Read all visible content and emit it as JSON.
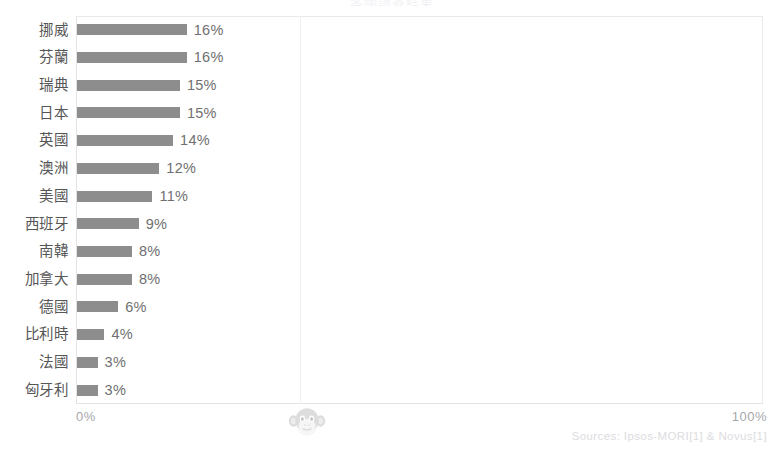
{
  "chart_data": {
    "type": "bar",
    "orientation": "horizontal",
    "title": "各國調查結果",
    "categories": [
      "挪威",
      "芬蘭",
      "瑞典",
      "日本",
      "英國",
      "澳洲",
      "美國",
      "西班牙",
      "南韓",
      "加拿大",
      "德國",
      "比利時",
      "法國",
      "匈牙利"
    ],
    "values": [
      16,
      16,
      15,
      15,
      14,
      12,
      11,
      9,
      8,
      8,
      6,
      4,
      3,
      3
    ],
    "value_labels": [
      "16%",
      "16%",
      "15%",
      "15%",
      "14%",
      "12%",
      "11%",
      "9%",
      "8%",
      "8%",
      "6%",
      "4%",
      "3%",
      "3%"
    ],
    "xlabel": "",
    "ylabel": "",
    "xlim": [
      0,
      100
    ],
    "xtick_labels": [
      "0%",
      "100%"
    ],
    "grid": true,
    "legend": false,
    "bar_color": "#8d8d8d",
    "label_color": "#565656",
    "value_color": "#6f6f6f",
    "axis_color": "#e3e3e6"
  },
  "axis": {
    "left_tick": "0%",
    "right_tick": "100%"
  },
  "footer": {
    "source": "Sources: Ipsos-MORI[1] & Novus[1]"
  },
  "watermark": {
    "name": "monkey-face-icon"
  }
}
